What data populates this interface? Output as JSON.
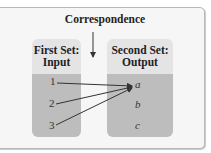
{
  "diagram": {
    "title": "Correspondence",
    "first_set": {
      "heading_line1": "First Set:",
      "heading_line2": "Input",
      "elements": [
        "1",
        "2",
        "3"
      ]
    },
    "second_set": {
      "heading_line1": "Second Set:",
      "heading_line2": "Output",
      "elements": [
        "a",
        "b",
        "c"
      ]
    },
    "mappings": [
      {
        "from": "1",
        "to": "a"
      },
      {
        "from": "2",
        "to": "a"
      },
      {
        "from": "3",
        "to": "a"
      }
    ],
    "colors": {
      "header_bg": "#e4e4e4",
      "body_bg": "#bdbdbd",
      "arrow": "#333333",
      "frame_bg": "#f6f6f6"
    }
  }
}
